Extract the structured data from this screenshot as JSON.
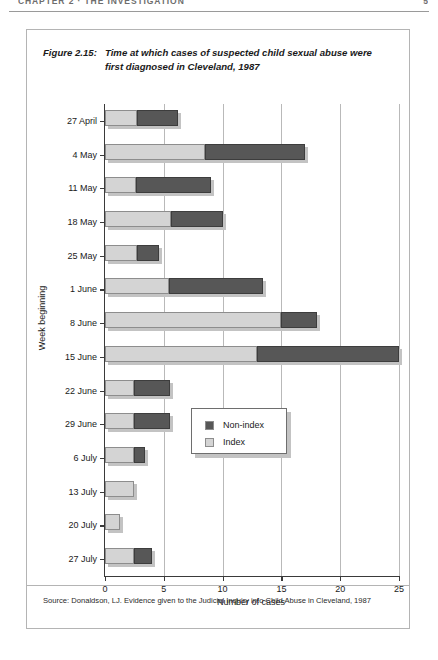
{
  "page_header": {
    "running_head": "CHAPTER 2 · THE INVESTIGATION",
    "page_number": "5"
  },
  "figure": {
    "label": "Figure 2.15:",
    "title": "Time at which cases of suspected child sexual abuse were first diagnosed in Cleveland, 1987",
    "source": "Source: Donaldson, LJ. Evidence given to the Judicial Inquiry into Child Abuse in Cleveland, 1987"
  },
  "legend": {
    "position": "inside-right",
    "items": [
      {
        "label": "Non-index",
        "color": "#575757",
        "key": "non_index"
      },
      {
        "label": "Index",
        "color": "#d4d4d4",
        "key": "index"
      }
    ]
  },
  "colors": {
    "index": "#d4d4d4",
    "non_index": "#575757",
    "bar_border": "#8d8d8d",
    "shadow": "#c3c3c3",
    "axis": "#3a3a3a",
    "grid": "#b9b9b9",
    "frame": "#b4b4b4"
  },
  "chart_data": {
    "type": "bar",
    "orientation": "horizontal",
    "stacked": true,
    "title": "Time at which cases of suspected child sexual abuse were first diagnosed in Cleveland, 1987",
    "xlabel": "Number of cases",
    "ylabel": "Week beginning",
    "xlim": [
      0,
      25
    ],
    "xticks": [
      0,
      5,
      10,
      15,
      20,
      25
    ],
    "xtick_labels": [
      "0",
      "5",
      "10",
      "15",
      "20",
      "25"
    ],
    "grid": "vertical",
    "categories": [
      "27 April",
      "4 May",
      "11 May",
      "18 May",
      "25 May",
      "1 June",
      "8 June",
      "15 June",
      "22 June",
      "29 June",
      "6 July",
      "13 July",
      "20 July",
      "27 July"
    ],
    "series": [
      {
        "name": "Index",
        "color": "#d4d4d4",
        "values": [
          2.7,
          8.5,
          2.6,
          5.6,
          2.7,
          5.4,
          15,
          12.9,
          2.5,
          2.5,
          2.5,
          2.5,
          1.3,
          2.5
        ]
      },
      {
        "name": "Non-index",
        "color": "#575757",
        "values": [
          3.5,
          8.5,
          6.4,
          4.4,
          1.9,
          8.0,
          3.0,
          12.1,
          3.0,
          3.0,
          0.9,
          0,
          0,
          1.5
        ]
      }
    ],
    "totals": [
      6.2,
      17.0,
      9.0,
      10.0,
      4.6,
      13.4,
      18.0,
      25.0,
      5.5,
      5.5,
      3.4,
      2.5,
      1.3,
      4.0
    ]
  }
}
